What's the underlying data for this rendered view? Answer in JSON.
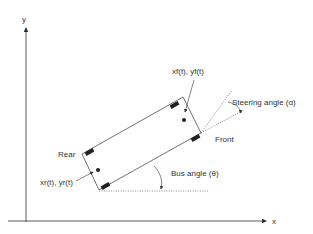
{
  "diagram": {
    "axes": {
      "x_label": "x",
      "y_label": "y"
    },
    "labels": {
      "front_position": "xₗ(t), yₗ(t)",
      "front_position_sub": "f",
      "rear_position": "xᵣ(t), yᵣ(t)",
      "steering_angle": "Steering angle (α)",
      "front": "Front",
      "rear": "Rear",
      "bus_angle": "Bus angle (θ)"
    },
    "text": {
      "front_pos": "xf(t), yf(t)",
      "rear_pos": "xr(t), yr(t)",
      "steering": "Steering angle (α)",
      "front": "Front",
      "rear": "Rear",
      "bus": "Bus angle (θ)",
      "x": "x",
      "y": "y"
    },
    "colors": {
      "line": "#333333",
      "background": "#ffffff"
    }
  }
}
